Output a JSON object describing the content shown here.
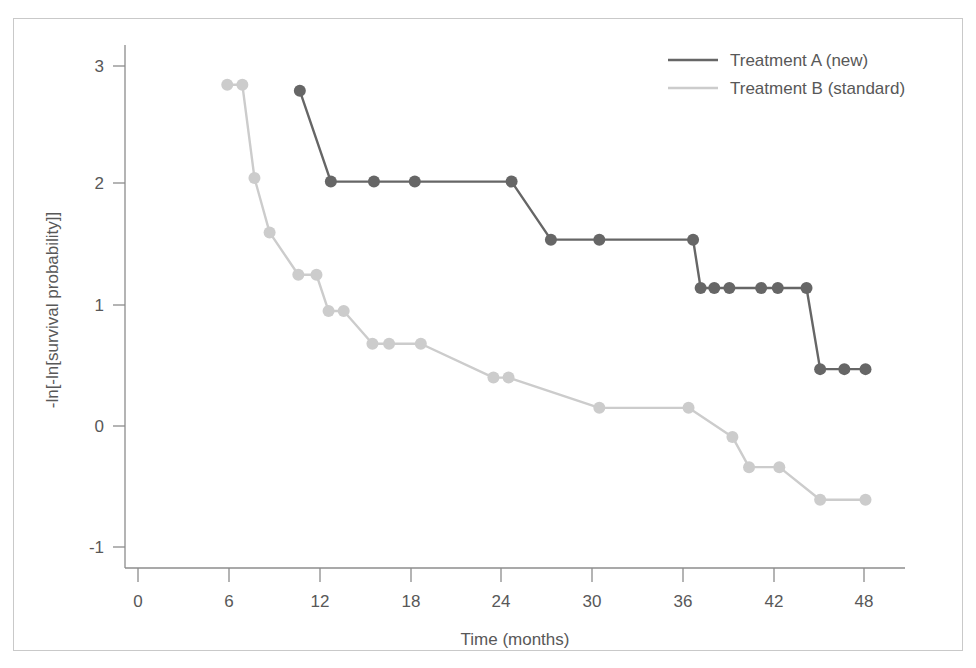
{
  "chart_data": {
    "type": "line",
    "title": "",
    "subtitle": "",
    "xlabel": "Time (months)",
    "ylabel": "-ln[-ln[survival probability]]",
    "xlim": [
      0,
      50
    ],
    "ylim": [
      -1.45,
      3.3
    ],
    "xticks": [
      0,
      6,
      12,
      18,
      24,
      30,
      36,
      42,
      48
    ],
    "yticks": [
      -1,
      0,
      1,
      2,
      3
    ],
    "xtick_labels": [
      "0",
      "6",
      "12",
      "18",
      "24",
      "30",
      "36",
      "42",
      "48"
    ],
    "ytick_labels": [
      "-1",
      "0",
      "1",
      "2",
      "3"
    ],
    "grid": false,
    "legend_position": "top-right",
    "style": "step-like survival log-log plot with markers",
    "series": [
      {
        "name": "Treatment A (new)",
        "color": "#666666",
        "marker": "circle",
        "x": [
          10.7,
          12.75,
          15.6,
          18.3,
          24.7,
          27.3,
          30.5,
          36.7,
          37.2,
          38.1,
          39.1,
          41.2,
          42.3,
          44.2,
          45.1,
          46.7,
          48.1
        ],
        "y": [
          2.77,
          2.02,
          2.02,
          2.02,
          2.02,
          1.54,
          1.54,
          1.54,
          1.14,
          1.14,
          1.14,
          1.14,
          1.14,
          1.14,
          0.47,
          0.47,
          0.47
        ]
      },
      {
        "name": "Treatment B (standard)",
        "color": "#cccccc",
        "marker": "circle",
        "x": [
          5.9,
          6.9,
          7.7,
          8.7,
          10.6,
          11.8,
          12.6,
          13.6,
          15.5,
          16.6,
          18.7,
          23.5,
          24.5,
          30.5,
          36.4,
          39.3,
          40.4,
          42.4,
          45.1,
          48.1
        ],
        "y": [
          2.82,
          2.82,
          2.05,
          1.6,
          1.25,
          1.25,
          0.95,
          0.95,
          0.68,
          0.68,
          0.68,
          0.4,
          0.4,
          0.15,
          0.15,
          -0.09,
          -0.34,
          -0.34,
          -0.61,
          -0.61
        ]
      }
    ]
  },
  "legend": {
    "entries": [
      {
        "label": "Treatment A (new)",
        "color": "#666666"
      },
      {
        "label": "Treatment B (standard)",
        "color": "#cccccc"
      }
    ]
  },
  "axes": {
    "x_title": "Time (months)",
    "y_title": "-ln[-ln[survival probability]]",
    "x_tick_labels": [
      "0",
      "6",
      "12",
      "18",
      "24",
      "30",
      "36",
      "42",
      "48"
    ],
    "y_tick_labels": [
      "3",
      "2",
      "1",
      "0",
      "-1"
    ]
  }
}
